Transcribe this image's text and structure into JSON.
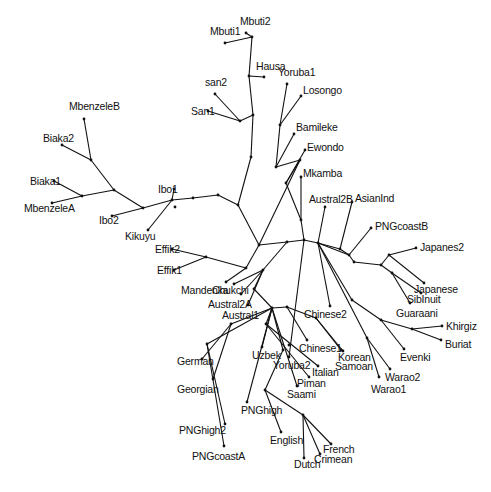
{
  "diagram": {
    "type": "unrooted phylogenetic tree",
    "taxa": [
      "Mbuti1",
      "Mbuti2",
      "Hausa",
      "san2",
      "San1",
      "Yoruba1",
      "Losongo",
      "Bamileke",
      "Ewondo",
      "Mkamba",
      "MbenzeleB",
      "Biaka2",
      "Biaka1",
      "MbenzeleA",
      "Ibo1",
      "Ibo2",
      "Kikuyu",
      "Austral2B",
      "AsianInd",
      "PNGcoastB",
      "Japanes2",
      "Japanese",
      "SibInuit",
      "Guaraani",
      "Effik2",
      "Effik1",
      "Mandenka",
      "Chukchi",
      "Austral2A",
      "Austral1",
      "Yoruba2",
      "Chinese2",
      "Khirgiz",
      "Buriat",
      "Evenki",
      "Korean",
      "Samoan",
      "Chinese1",
      "Warao2",
      "Warao1",
      "German",
      "Georgian",
      "Uzbek",
      "Italian",
      "Piman",
      "Saami",
      "PNGhigh",
      "PNGhigh2",
      "PNGcoastA",
      "English",
      "French",
      "Crimean",
      "Dutch"
    ]
  }
}
